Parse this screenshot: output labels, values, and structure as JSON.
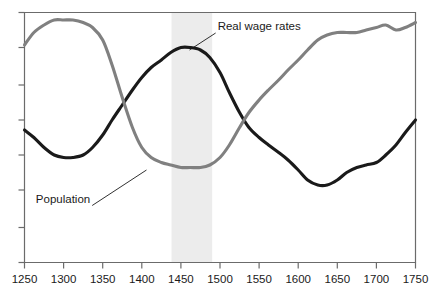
{
  "chart_data": {
    "type": "line",
    "title": "",
    "subtitle": "",
    "xlabel": "",
    "ylabel": "",
    "xlim": [
      1250,
      1750
    ],
    "ylim": [
      0,
      100
    ],
    "grid": false,
    "legend_position": "inline-annotations",
    "x_ticks": [
      1250,
      1300,
      1350,
      1400,
      1450,
      1500,
      1550,
      1600,
      1650,
      1700,
      1750
    ],
    "x_tick_labels": [
      "1250",
      "1300",
      "1350",
      "1400",
      "1450",
      "1500",
      "1550",
      "1600",
      "1650",
      "1700",
      "1750"
    ],
    "y_ticks": [
      0,
      14,
      29,
      43,
      57,
      71,
      86,
      100
    ],
    "y_tick_labels": [
      "",
      "",
      "",
      "",
      "",
      "",
      "",
      ""
    ],
    "y_axis_labelled": false,
    "shaded_band": {
      "label": "",
      "x_start": 1438,
      "x_end": 1490,
      "color": "#ececec"
    },
    "series": [
      {
        "name": "Real wage rates",
        "color": "#1a1a1a",
        "annotation": {
          "text": "Real wage rates",
          "text_x": 1497,
          "text_y": 93,
          "anchor_x": 1461,
          "anchor_y": 85
        },
        "x": [
          1250,
          1262,
          1275,
          1288,
          1300,
          1312,
          1325,
          1337,
          1350,
          1362,
          1375,
          1388,
          1400,
          1412,
          1425,
          1437,
          1450,
          1462,
          1475,
          1487,
          1500,
          1512,
          1525,
          1537,
          1550,
          1562,
          1575,
          1587,
          1600,
          1612,
          1625,
          1637,
          1650,
          1662,
          1675,
          1687,
          1700,
          1712,
          1725,
          1737,
          1750
        ],
        "y": [
          53,
          50,
          46,
          43,
          42,
          42,
          43,
          46,
          51,
          57,
          63,
          69,
          74,
          78,
          81,
          84,
          86,
          86,
          85,
          82,
          76,
          68,
          60,
          54,
          50,
          47,
          44,
          41,
          37,
          33,
          31,
          31,
          33,
          36,
          38,
          39,
          40,
          43,
          47,
          52,
          57
        ]
      },
      {
        "name": "Population",
        "color": "#808080",
        "annotation": {
          "text": "Population",
          "text_x": 1334,
          "text_y": 24,
          "anchor_x": 1406,
          "anchor_y": 37
        },
        "x": [
          1250,
          1262,
          1275,
          1288,
          1300,
          1312,
          1325,
          1337,
          1350,
          1362,
          1375,
          1388,
          1400,
          1412,
          1425,
          1437,
          1450,
          1462,
          1475,
          1487,
          1500,
          1512,
          1525,
          1537,
          1550,
          1562,
          1575,
          1587,
          1600,
          1612,
          1625,
          1637,
          1650,
          1662,
          1675,
          1687,
          1700,
          1712,
          1725,
          1737,
          1750
        ],
        "y": [
          87,
          92,
          95,
          97,
          97,
          97,
          96,
          94,
          89,
          79,
          66,
          54,
          46,
          42,
          40,
          39,
          38,
          38,
          38,
          39,
          42,
          47,
          54,
          60,
          65,
          69,
          73,
          77,
          81,
          85,
          89,
          91,
          92,
          92,
          92,
          93,
          94,
          95,
          93,
          94,
          96
        ]
      }
    ]
  },
  "axes": {
    "border_color": "#6b6b6b"
  }
}
